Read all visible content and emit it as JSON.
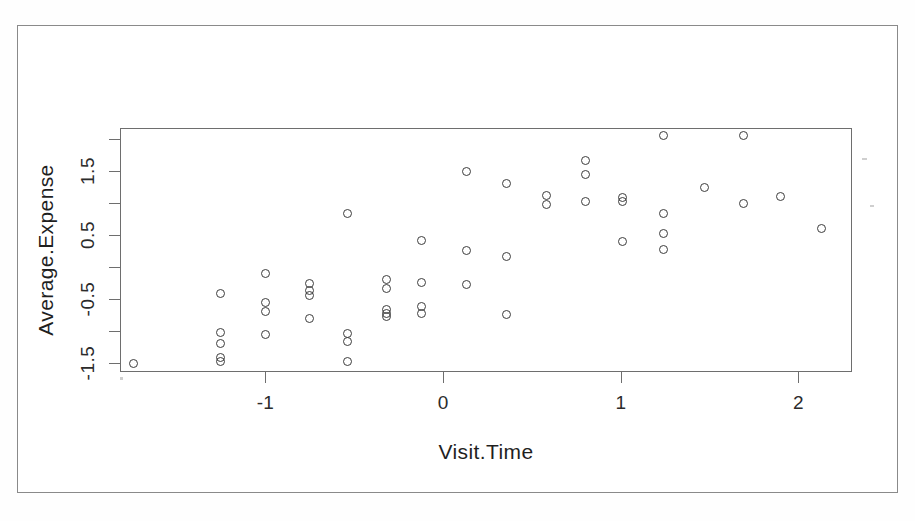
{
  "figure": {
    "kind": "scatter-plot",
    "background_color": "#ffffff",
    "frame_color": "#6e6e6e",
    "point_color": "#3d3d3d",
    "point_symbol": "open-circle"
  },
  "chart_data": {
    "type": "scatter",
    "title": "",
    "xlabel": "Visit.Time",
    "ylabel": "Average.Expense",
    "xlim": [
      -1.82,
      2.3
    ],
    "ylim": [
      -1.63,
      2.19
    ],
    "grid": false,
    "legend": null,
    "xticks": [
      -1,
      0,
      1,
      2
    ],
    "xtick_labels": [
      "-1",
      "0",
      "1",
      "2"
    ],
    "yticks": [
      -1.5,
      -0.5,
      0.5,
      1.5
    ],
    "ytick_labels": [
      "-1.5",
      "-0.5",
      "0.5",
      "1.5"
    ],
    "yticks_minor": [
      -1.0,
      0.0,
      1.0,
      2.0
    ],
    "n_points": 56,
    "points": [
      {
        "x": -1.74,
        "y": -1.5
      },
      {
        "x": -1.25,
        "y": -0.42
      },
      {
        "x": -1.25,
        "y": -1.02
      },
      {
        "x": -1.25,
        "y": -1.2
      },
      {
        "x": -1.25,
        "y": -1.42
      },
      {
        "x": -1.25,
        "y": -1.48
      },
      {
        "x": -1.0,
        "y": -0.1
      },
      {
        "x": -1.0,
        "y": -0.56
      },
      {
        "x": -1.0,
        "y": -0.7
      },
      {
        "x": -1.0,
        "y": -1.05
      },
      {
        "x": -0.75,
        "y": -0.26
      },
      {
        "x": -0.75,
        "y": -0.36
      },
      {
        "x": -0.75,
        "y": -0.44
      },
      {
        "x": -0.75,
        "y": -0.8
      },
      {
        "x": -0.54,
        "y": 0.84
      },
      {
        "x": -0.54,
        "y": -1.04
      },
      {
        "x": -0.54,
        "y": -1.16
      },
      {
        "x": -0.54,
        "y": -1.47
      },
      {
        "x": -0.32,
        "y": -0.19
      },
      {
        "x": -0.32,
        "y": -0.34
      },
      {
        "x": -0.32,
        "y": -0.66
      },
      {
        "x": -0.32,
        "y": -0.72
      },
      {
        "x": -0.32,
        "y": -0.78
      },
      {
        "x": -0.12,
        "y": 0.42
      },
      {
        "x": -0.12,
        "y": -0.24
      },
      {
        "x": -0.12,
        "y": -0.62
      },
      {
        "x": -0.12,
        "y": -0.72
      },
      {
        "x": 0.13,
        "y": 1.5
      },
      {
        "x": 0.13,
        "y": 0.26
      },
      {
        "x": 0.13,
        "y": -0.28
      },
      {
        "x": 0.36,
        "y": 1.3
      },
      {
        "x": 0.36,
        "y": 0.17
      },
      {
        "x": 0.36,
        "y": -0.74
      },
      {
        "x": 0.58,
        "y": 1.11
      },
      {
        "x": 0.58,
        "y": 0.97
      },
      {
        "x": 0.8,
        "y": 1.66
      },
      {
        "x": 0.8,
        "y": 1.44
      },
      {
        "x": 0.8,
        "y": 1.03
      },
      {
        "x": 1.01,
        "y": 1.08
      },
      {
        "x": 1.01,
        "y": 1.03
      },
      {
        "x": 1.01,
        "y": 0.4
      },
      {
        "x": 1.24,
        "y": 2.05
      },
      {
        "x": 1.24,
        "y": 0.83
      },
      {
        "x": 1.24,
        "y": 0.52
      },
      {
        "x": 1.24,
        "y": 0.28
      },
      {
        "x": 1.47,
        "y": 1.24
      },
      {
        "x": 1.69,
        "y": 2.05
      },
      {
        "x": 1.69,
        "y": 1.0
      },
      {
        "x": 1.9,
        "y": 1.1
      },
      {
        "x": 2.13,
        "y": 0.6
      }
    ]
  }
}
